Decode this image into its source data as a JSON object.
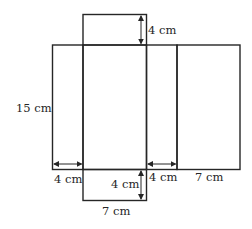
{
  "diagram": {
    "type": "net-of-rectangular-prism",
    "ink_color": "#262626",
    "labels": {
      "top_flap_height": "4 cm",
      "height": "15 cm",
      "left_width": "4 cm",
      "bottom_flap_height": "4 cm",
      "right_narrow_width": "4 cm",
      "right_wide_width": "7 cm",
      "bottom_flap_width": "7 cm"
    },
    "dimensions": {
      "length_cm": 7,
      "width_cm": 4,
      "height_cm": 15
    }
  }
}
